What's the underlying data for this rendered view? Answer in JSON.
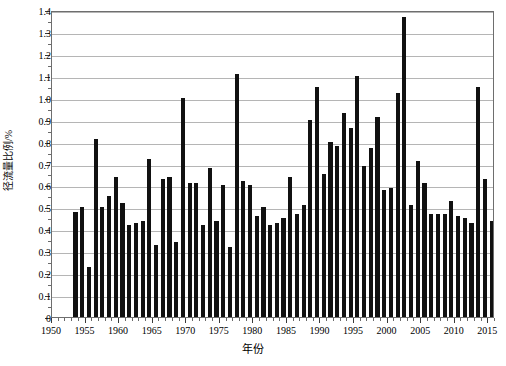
{
  "chart_data": {
    "type": "bar",
    "title": "",
    "xlabel": "年份",
    "ylabel": "径流量比例/%",
    "xlim": [
      1950,
      2016
    ],
    "ylim": [
      0,
      1.4
    ],
    "grid": true,
    "legend": null,
    "y_ticks": [
      "0",
      "0.1",
      "0.2",
      "0.3",
      "0.4",
      "0.5",
      "0.6",
      "0.7",
      "0.8",
      "0.9",
      "1.0",
      "1.1",
      "1.2",
      "1.3",
      "1.4"
    ],
    "y_tick_values": [
      0,
      0.1,
      0.2,
      0.3,
      0.4,
      0.5,
      0.6,
      0.7,
      0.8,
      0.9,
      1.0,
      1.1,
      1.2,
      1.3,
      1.4
    ],
    "x_ticks": [
      "1950",
      "1955",
      "1960",
      "1965",
      "1970",
      "1975",
      "1980",
      "1985",
      "1990",
      "1995",
      "2000",
      "2005",
      "2010",
      "2015"
    ],
    "x_tick_values": [
      1950,
      1955,
      1960,
      1965,
      1970,
      1975,
      1980,
      1985,
      1990,
      1995,
      2000,
      2005,
      2010,
      2015
    ],
    "bar_color": "#111111",
    "categories": [
      1953,
      1954,
      1955,
      1956,
      1957,
      1958,
      1959,
      1960,
      1961,
      1962,
      1963,
      1964,
      1965,
      1966,
      1967,
      1968,
      1969,
      1970,
      1971,
      1972,
      1973,
      1974,
      1975,
      1976,
      1977,
      1978,
      1979,
      1980,
      1981,
      1982,
      1983,
      1984,
      1985,
      1986,
      1987,
      1988,
      1989,
      1990,
      1991,
      1992,
      1993,
      1994,
      1995,
      1996,
      1997,
      1998,
      1999,
      2000,
      2001,
      2002,
      2003,
      2004,
      2005,
      2006,
      2007,
      2008,
      2009,
      2010,
      2011,
      2012,
      2013,
      2014,
      2015
    ],
    "values": [
      0.48,
      0.5,
      0.23,
      0.81,
      0.5,
      0.55,
      0.64,
      0.52,
      0.42,
      0.43,
      0.44,
      0.72,
      0.33,
      0.63,
      0.64,
      0.34,
      1.0,
      0.61,
      0.61,
      0.42,
      0.68,
      0.44,
      0.6,
      0.32,
      1.11,
      0.62,
      0.6,
      0.46,
      0.5,
      0.42,
      0.43,
      0.45,
      0.64,
      0.47,
      0.51,
      0.9,
      1.05,
      0.65,
      0.8,
      0.78,
      0.93,
      0.86,
      1.1,
      0.69,
      0.77,
      0.91,
      0.58,
      0.59,
      1.02,
      1.37,
      0.51,
      0.71,
      0.61,
      0.47,
      0.47,
      0.47,
      0.53,
      0.46,
      0.45,
      0.43,
      1.05,
      0.63,
      0.44
    ]
  }
}
